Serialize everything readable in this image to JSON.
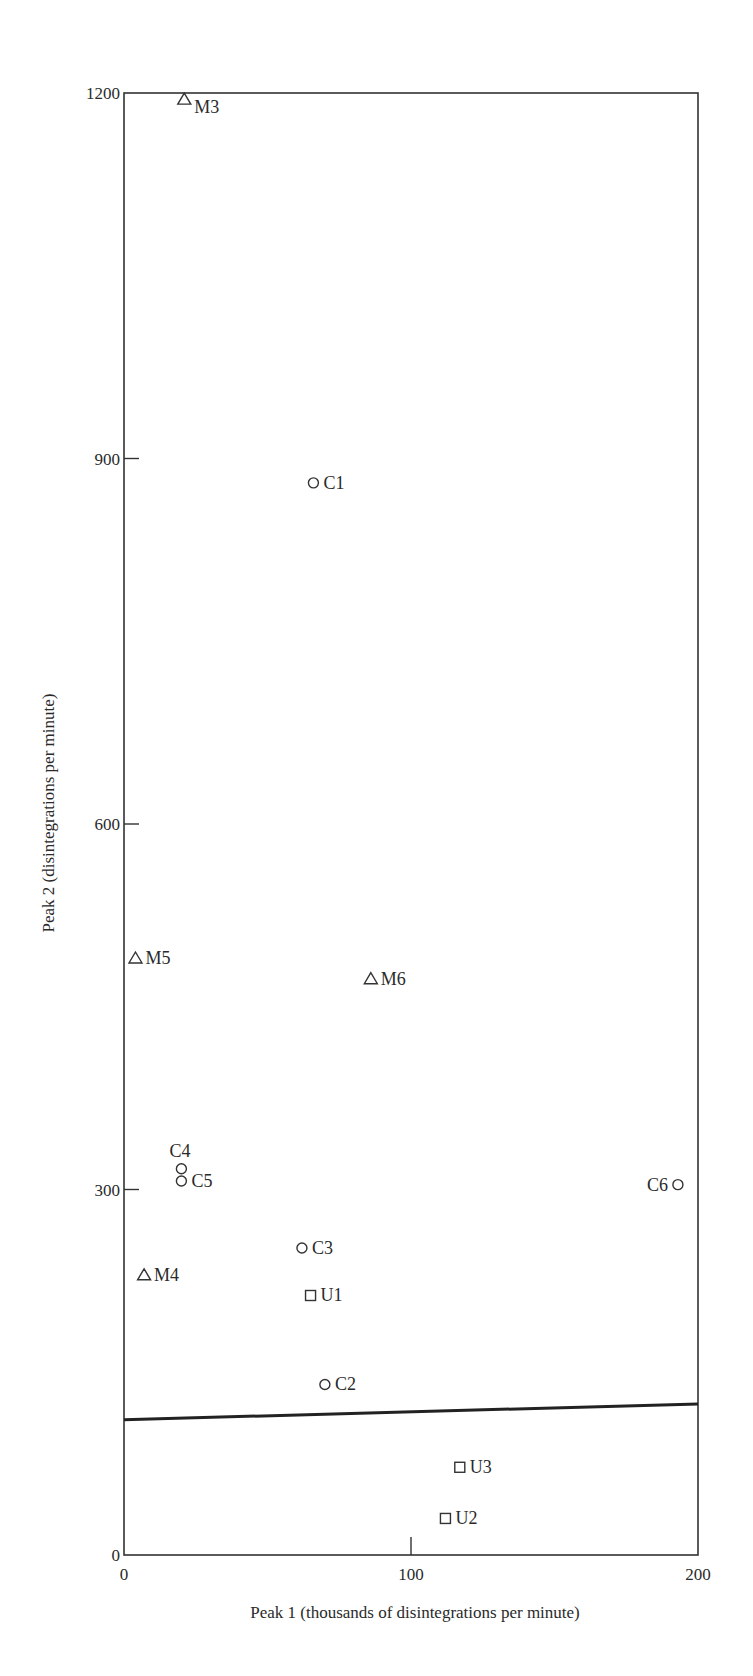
{
  "chart_data": {
    "type": "scatter",
    "title": "",
    "xlabel": "Peak 1 (thousands of disintegrations per minute)",
    "ylabel": "Peak 2 (disintegrations per minute)",
    "xlim": [
      0,
      200
    ],
    "ylim": [
      0,
      1200
    ],
    "xticks": [
      0,
      100,
      200
    ],
    "yticks": [
      0,
      300,
      600,
      900,
      1200
    ],
    "grid": false,
    "legend": null,
    "series": [
      {
        "name": "M",
        "marker": "triangle",
        "points": [
          {
            "label": "M3",
            "x": 21,
            "y": 1195,
            "label_pos": "below-right"
          },
          {
            "label": "M5",
            "x": 4,
            "y": 490,
            "label_pos": "right"
          },
          {
            "label": "M6",
            "x": 86,
            "y": 473,
            "label_pos": "right"
          },
          {
            "label": "M4",
            "x": 7,
            "y": 230,
            "label_pos": "right"
          }
        ]
      },
      {
        "name": "C",
        "marker": "circle",
        "points": [
          {
            "label": "C1",
            "x": 66,
            "y": 880,
            "label_pos": "right"
          },
          {
            "label": "C4",
            "x": 20,
            "y": 317,
            "label_pos": "above"
          },
          {
            "label": "C5",
            "x": 20,
            "y": 307,
            "label_pos": "right"
          },
          {
            "label": "C6",
            "x": 193,
            "y": 304,
            "label_pos": "left"
          },
          {
            "label": "C3",
            "x": 62,
            "y": 252,
            "label_pos": "right"
          },
          {
            "label": "C2",
            "x": 70,
            "y": 140,
            "label_pos": "right"
          }
        ]
      },
      {
        "name": "U",
        "marker": "square",
        "points": [
          {
            "label": "U1",
            "x": 65,
            "y": 213,
            "label_pos": "right"
          },
          {
            "label": "U3",
            "x": 117,
            "y": 72,
            "label_pos": "right"
          },
          {
            "label": "U2",
            "x": 112,
            "y": 30,
            "label_pos": "right"
          }
        ]
      }
    ],
    "lines": [
      {
        "name": "separator-line",
        "x": [
          0,
          200
        ],
        "y": [
          111,
          124
        ],
        "width": 3
      }
    ],
    "annotations": []
  },
  "style": {
    "axis_color": "#333333",
    "marker_color": "#333333",
    "line_color": "#222222"
  }
}
